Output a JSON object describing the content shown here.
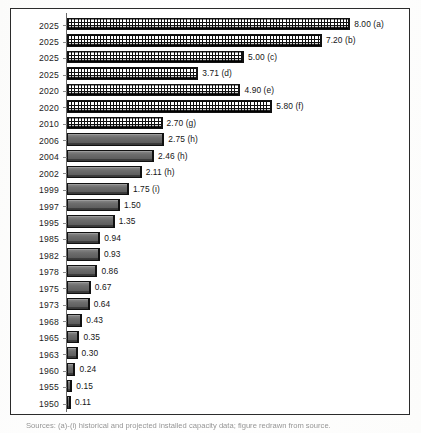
{
  "figure": {
    "caption": "Sources: (a)-(i) historical and projected installed capacity data; figure redrawn from source."
  },
  "chart_data": {
    "type": "bar",
    "orientation": "horizontal",
    "title": "",
    "xlabel": "",
    "ylabel": "",
    "xlim": [
      0,
      8
    ],
    "grid": false,
    "legend": null,
    "categories": [
      "2025",
      "2025",
      "2025",
      "2025",
      "2020",
      "2020",
      "2010",
      "2006",
      "2004",
      "2002",
      "1999",
      "1997",
      "1995",
      "1985",
      "1982",
      "1978",
      "1975",
      "1973",
      "1968",
      "1965",
      "1963",
      "1960",
      "1955",
      "1950"
    ],
    "values": [
      8.0,
      7.2,
      5.0,
      3.71,
      4.9,
      5.8,
      2.7,
      2.75,
      2.46,
      2.11,
      1.75,
      1.5,
      1.35,
      0.94,
      0.93,
      0.86,
      0.67,
      0.64,
      0.43,
      0.35,
      0.3,
      0.24,
      0.15,
      0.11
    ],
    "data_labels": [
      "8.00 (a)",
      "7.20 (b)",
      "5.00  (c)",
      "3.71 (d)",
      "4.90  (e)",
      "5.80 (f)",
      "2.70 (g)",
      "2.75 (h)",
      "2.46 (h)",
      "2.11  (h)",
      "1.75  (i)",
      "1.50",
      "1.35",
      "0.94",
      "0.93",
      "0.86",
      "0.67",
      "0.64",
      "0.43",
      "0.35",
      "0.30",
      "0.24",
      "0.15",
      "0.11"
    ],
    "series_styles": [
      "hatch",
      "hatch",
      "hatch",
      "hatch",
      "hatch",
      "hatch",
      "hatch",
      "solid",
      "solid",
      "solid",
      "solid",
      "solid",
      "solid",
      "solid",
      "solid",
      "solid",
      "solid",
      "solid",
      "solid",
      "solid",
      "solid",
      "solid",
      "solid",
      "solid"
    ],
    "rows": [
      {
        "year": "2025",
        "value": 8.0,
        "label": "8.00 (a)",
        "style": "hatch"
      },
      {
        "year": "2025",
        "value": 7.2,
        "label": "7.20 (b)",
        "style": "hatch"
      },
      {
        "year": "2025",
        "value": 5.0,
        "label": "5.00  (c)",
        "style": "hatch"
      },
      {
        "year": "2025",
        "value": 3.71,
        "label": "3.71 (d)",
        "style": "hatch"
      },
      {
        "year": "2020",
        "value": 4.9,
        "label": "4.90  (e)",
        "style": "hatch"
      },
      {
        "year": "2020",
        "value": 5.8,
        "label": "5.80 (f)",
        "style": "hatch"
      },
      {
        "year": "2010",
        "value": 2.7,
        "label": "2.70 (g)",
        "style": "hatch"
      },
      {
        "year": "2006",
        "value": 2.75,
        "label": "2.75 (h)",
        "style": "solid"
      },
      {
        "year": "2004",
        "value": 2.46,
        "label": "2.46 (h)",
        "style": "solid"
      },
      {
        "year": "2002",
        "value": 2.11,
        "label": "2.11  (h)",
        "style": "solid"
      },
      {
        "year": "1999",
        "value": 1.75,
        "label": "1.75  (i)",
        "style": "solid"
      },
      {
        "year": "1997",
        "value": 1.5,
        "label": "1.50",
        "style": "solid"
      },
      {
        "year": "1995",
        "value": 1.35,
        "label": "1.35",
        "style": "solid"
      },
      {
        "year": "1985",
        "value": 0.94,
        "label": "0.94",
        "style": "solid"
      },
      {
        "year": "1982",
        "value": 0.93,
        "label": "0.93",
        "style": "solid"
      },
      {
        "year": "1978",
        "value": 0.86,
        "label": "0.86",
        "style": "solid"
      },
      {
        "year": "1975",
        "value": 0.67,
        "label": "0.67",
        "style": "solid"
      },
      {
        "year": "1973",
        "value": 0.64,
        "label": "0.64",
        "style": "solid"
      },
      {
        "year": "1968",
        "value": 0.43,
        "label": "0.43",
        "style": "solid"
      },
      {
        "year": "1965",
        "value": 0.35,
        "label": "0.35",
        "style": "solid"
      },
      {
        "year": "1963",
        "value": 0.3,
        "label": "0.30",
        "style": "solid"
      },
      {
        "year": "1960",
        "value": 0.24,
        "label": "0.24",
        "style": "solid"
      },
      {
        "year": "1955",
        "value": 0.15,
        "label": "0.15",
        "style": "solid"
      },
      {
        "year": "1950",
        "value": 0.11,
        "label": "0.11",
        "style": "solid"
      }
    ]
  },
  "render": {
    "px_per_unit": 35.4,
    "row_height": 16.45,
    "first_row_top": 7
  }
}
